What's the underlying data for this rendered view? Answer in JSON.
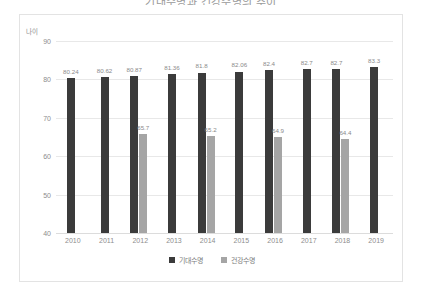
{
  "chart_data": {
    "type": "bar",
    "title": "기대수명과 건강수명의 추이",
    "xlabel": "",
    "ylabel": "나이",
    "ylim": [
      40,
      90
    ],
    "yticks": [
      40,
      50,
      60,
      70,
      80,
      90
    ],
    "grid": true,
    "legend_position": "bottom",
    "categories": [
      "2010",
      "2011",
      "2012",
      "2013",
      "2014",
      "2015",
      "2016",
      "2017",
      "2018",
      "2019"
    ],
    "series": [
      {
        "name": "기대수명",
        "color": "#3b3b3b",
        "values": [
          80.24,
          80.62,
          80.87,
          81.36,
          81.8,
          82.06,
          82.4,
          82.7,
          82.7,
          83.3
        ],
        "labels": [
          "80.24",
          "80.62",
          "80.87",
          "81.36",
          "81.8",
          "82.06",
          "82.4",
          "82.7",
          "82.7",
          "83.3"
        ]
      },
      {
        "name": "건강수명",
        "color": "#a5a5a5",
        "values": [
          null,
          null,
          65.7,
          null,
          65.2,
          null,
          64.9,
          null,
          64.4,
          null
        ],
        "labels": [
          "",
          "",
          "65.7",
          "",
          "65.2",
          "",
          "64.9",
          "",
          "64.4",
          ""
        ]
      }
    ]
  },
  "legend": {
    "items": [
      {
        "label": "기대수명",
        "color": "#3b3b3b"
      },
      {
        "label": "건강수명",
        "color": "#a5a5a5"
      }
    ]
  }
}
